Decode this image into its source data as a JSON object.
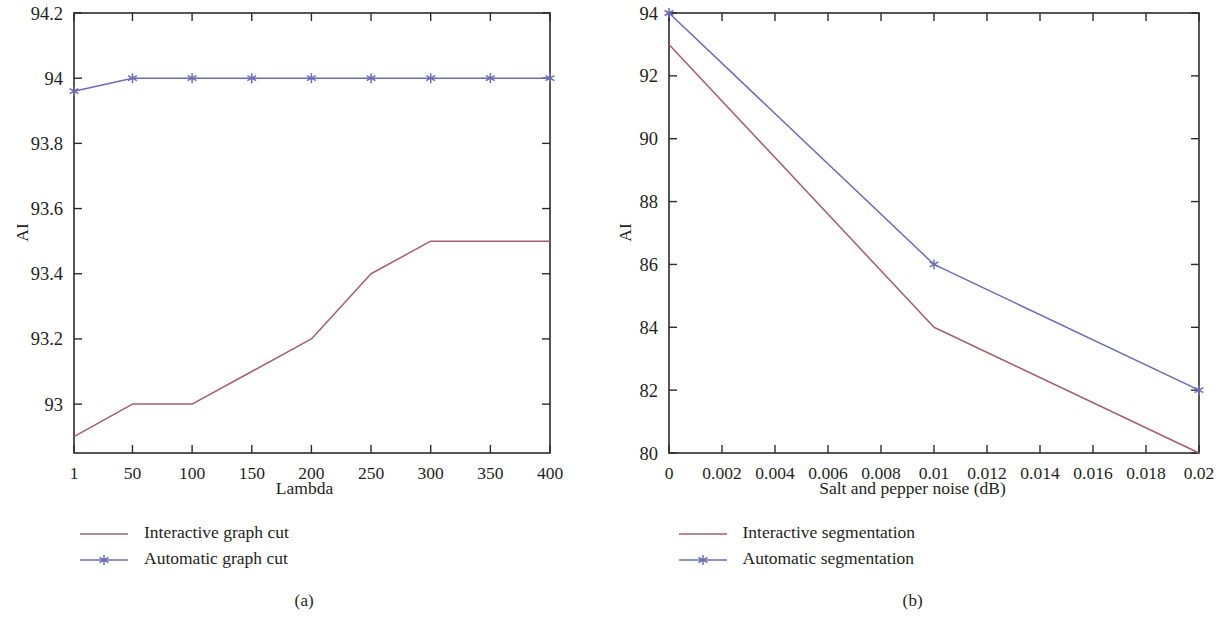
{
  "figure": {
    "panels": [
      {
        "caption": "(a)",
        "xlabel": "Lambda",
        "ylabel": "AI",
        "xticks": [
          "1",
          "50",
          "100",
          "150",
          "200",
          "250",
          "300",
          "350",
          "400"
        ],
        "yticks": [
          "93",
          "93.2",
          "93.4",
          "93.6",
          "93.8",
          "94",
          "94.2"
        ],
        "legend": [
          {
            "label": "Interactive graph cut",
            "marker": "none",
            "color": "#a35f6c"
          },
          {
            "label": "Automatic graph cut",
            "marker": "star",
            "color": "#6b6bb8"
          }
        ]
      },
      {
        "caption": "(b)",
        "xlabel": "Salt and pepper noise (dB)",
        "ylabel": "AI",
        "xticks": [
          "0",
          "0.002",
          "0.004",
          "0.006",
          "0.008",
          "0.01",
          "0.012",
          "0.014",
          "0.016",
          "0.018",
          "0.02"
        ],
        "yticks": [
          "80",
          "82",
          "84",
          "86",
          "88",
          "90",
          "92",
          "94"
        ],
        "legend": [
          {
            "label": "Interactive segmentation",
            "marker": "none",
            "color": "#a35f6c"
          },
          {
            "label": "Automatic segmentation",
            "marker": "star",
            "color": "#6b6bb8"
          }
        ]
      }
    ]
  },
  "colors": {
    "interactive": "#a35f6c",
    "automatic": "#6b6bb8",
    "axis": "#2e2b2c",
    "text": "#231f20"
  },
  "chart_data": [
    {
      "type": "line",
      "title": "(a)",
      "xlabel": "Lambda",
      "ylabel": "AI",
      "x": [
        1,
        50,
        100,
        150,
        200,
        250,
        300,
        350,
        400
      ],
      "xlim": [
        1,
        400
      ],
      "ylim": [
        92.85,
        94.2
      ],
      "yticks": [
        93,
        93.2,
        93.4,
        93.6,
        93.8,
        94,
        94.2
      ],
      "xticks": [
        1,
        50,
        100,
        150,
        200,
        250,
        300,
        350,
        400
      ],
      "grid": false,
      "legend_position": "below-left",
      "series": [
        {
          "name": "Interactive graph cut",
          "color": "#a35f6c",
          "marker": "none",
          "values": [
            92.9,
            93.0,
            93.0,
            93.1,
            93.2,
            93.4,
            93.5,
            93.5,
            93.5
          ]
        },
        {
          "name": "Automatic graph cut",
          "color": "#6b6bb8",
          "marker": "star",
          "values": [
            93.96,
            94.0,
            94.0,
            94.0,
            94.0,
            94.0,
            94.0,
            94.0,
            94.0
          ]
        }
      ]
    },
    {
      "type": "line",
      "title": "(b)",
      "xlabel": "Salt and pepper noise (dB)",
      "ylabel": "AI",
      "x": [
        0,
        0.01,
        0.02
      ],
      "xlim": [
        0,
        0.02
      ],
      "ylim": [
        80,
        94
      ],
      "yticks": [
        80,
        82,
        84,
        86,
        88,
        90,
        92,
        94
      ],
      "xticks": [
        0,
        0.002,
        0.004,
        0.006,
        0.008,
        0.01,
        0.012,
        0.014,
        0.016,
        0.018,
        0.02
      ],
      "grid": false,
      "legend_position": "below-left",
      "series": [
        {
          "name": "Interactive segmentation",
          "color": "#a35f6c",
          "marker": "none",
          "values": [
            93,
            84,
            80
          ]
        },
        {
          "name": "Automatic segmentation",
          "color": "#6b6bb8",
          "marker": "star",
          "values": [
            94,
            86,
            82
          ]
        }
      ]
    }
  ]
}
